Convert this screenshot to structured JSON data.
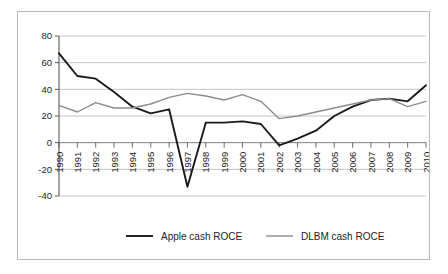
{
  "chart_data": {
    "type": "line",
    "title": "",
    "xlabel": "",
    "ylabel": "",
    "ylim": [
      -40,
      80
    ],
    "yticks": [
      -40,
      -20,
      0,
      20,
      40,
      60,
      80
    ],
    "ytick_labels": [
      "-40",
      "-20",
      "0",
      "20",
      "40",
      "60",
      "80"
    ],
    "grid": true,
    "grid_axis": "y",
    "legend_position": "bottom",
    "categories": [
      1990,
      1991,
      1992,
      1993,
      1994,
      1995,
      1996,
      1997,
      1998,
      1999,
      2000,
      2001,
      2002,
      2003,
      2004,
      2005,
      2006,
      2007,
      2008,
      2009,
      2010
    ],
    "xtick_labels": [
      "1990",
      "1991",
      "1992",
      "1993",
      "1994",
      "1995",
      "1996",
      "1997",
      "1998",
      "1999",
      "2000",
      "2001",
      "2002",
      "2003",
      "2004",
      "2005",
      "2006",
      "2007",
      "2008",
      "2009",
      "2010"
    ],
    "series": [
      {
        "name": "Apple cash ROCE",
        "color": "#1a1a1a",
        "width": 1.9,
        "values": [
          67,
          50,
          48,
          38,
          27,
          22,
          25,
          -33,
          15,
          15,
          16,
          14,
          -2,
          3,
          9,
          20,
          27,
          32,
          33,
          31,
          43
        ]
      },
      {
        "name": "DLBM cash ROCE",
        "color": "#8c8c8c",
        "width": 1.4,
        "values": [
          28,
          23,
          30,
          26,
          26,
          29,
          34,
          37,
          35,
          32,
          36,
          31,
          18,
          20,
          23,
          26,
          29,
          32,
          33,
          27,
          31
        ]
      }
    ]
  },
  "legend": {
    "items": [
      {
        "label": "Apple cash ROCE",
        "color": "#1a1a1a"
      },
      {
        "label": "DLBM cash ROCE",
        "color": "#8c8c8c"
      }
    ]
  }
}
